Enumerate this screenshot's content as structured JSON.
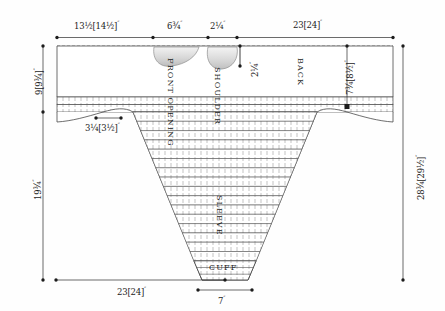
{
  "diagram": {
    "colors": {
      "outline": "#3a3a3a",
      "dimension_line": "#2b2b2b",
      "rib_fill": "#ffffff",
      "neck_shade": "#d9d9d9",
      "background": "#fefefe"
    },
    "top_dimensions": [
      {
        "name": "left-body-width",
        "value": "13½[14½]",
        "unit": "″"
      },
      {
        "name": "front-opening-width",
        "value": "6¾",
        "unit": "″"
      },
      {
        "name": "shoulder-gap-width",
        "value": "2¼",
        "unit": "″"
      },
      {
        "name": "back-width",
        "value": "23[24]",
        "unit": "″"
      }
    ],
    "left_dimensions": [
      {
        "name": "yoke-depth",
        "value": "9[9¾]",
        "unit": "″"
      },
      {
        "name": "body-length",
        "value": "19¾",
        "unit": "″"
      }
    ],
    "right_dimensions": [
      {
        "name": "total-length",
        "value": "28¾[29½]",
        "unit": "″"
      },
      {
        "name": "armhole-depth",
        "value": "7¾[8½]",
        "unit": "″"
      }
    ],
    "inner_dimensions": [
      {
        "name": "neck-depth",
        "value": "2¼",
        "unit": "″"
      },
      {
        "name": "underarm-width",
        "value": "3¼[3½]",
        "unit": "″"
      }
    ],
    "bottom_dimensions": [
      {
        "name": "lower-body-width",
        "value": "23[24]",
        "unit": "″"
      },
      {
        "name": "cuff-width",
        "value": "7",
        "unit": "″"
      }
    ],
    "part_labels": [
      {
        "name": "front-opening",
        "text": "FRONT OPENING"
      },
      {
        "name": "shoulder",
        "text": "SHOULDER"
      },
      {
        "name": "back",
        "text": "BACK"
      },
      {
        "name": "sleeve",
        "text": "SLEEVE"
      },
      {
        "name": "cuff",
        "text": "CUFF"
      }
    ]
  }
}
